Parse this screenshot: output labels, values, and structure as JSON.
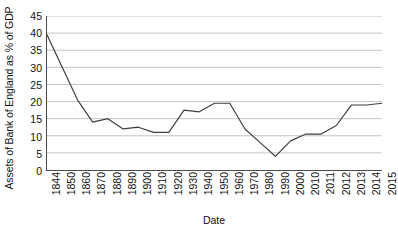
{
  "chart_data": {
    "type": "line",
    "title": "",
    "xlabel": "Date",
    "ylabel": "Assets of Bank of England as % of GDP",
    "categories": [
      "1844",
      "1850",
      "1860",
      "1870",
      "1880",
      "1890",
      "1900",
      "1910",
      "1920",
      "1930",
      "1940",
      "1950",
      "1960",
      "1970",
      "1980",
      "1990",
      "2000",
      "2010",
      "2011",
      "2012",
      "2013",
      "2014",
      "2015"
    ],
    "values": [
      39.5,
      30.0,
      20.5,
      14.0,
      15.0,
      12.0,
      12.5,
      11.0,
      11.0,
      17.5,
      17.0,
      19.5,
      19.5,
      12.0,
      8.0,
      4.0,
      8.5,
      10.5,
      10.5,
      13.0,
      19.0,
      19.0,
      19.5
    ],
    "series": [
      {
        "name": "Assets of Bank of England as % of GDP",
        "values": [
          39.5,
          30.0,
          20.5,
          14.0,
          15.0,
          12.0,
          12.5,
          11.0,
          11.0,
          17.5,
          17.0,
          19.5,
          19.5,
          12.0,
          8.0,
          4.0,
          8.5,
          10.5,
          10.5,
          13.0,
          19.0,
          19.0,
          19.5
        ],
        "color": "#3f3f3f"
      }
    ],
    "ylim": [
      0,
      45
    ],
    "ytick_step": 5,
    "yticks": [
      0,
      5,
      10,
      15,
      20,
      25,
      30,
      35,
      40,
      45
    ],
    "ytick_labels": [
      "0",
      "5",
      "10",
      "15",
      "20",
      "25",
      "30",
      "35",
      "40",
      "45"
    ],
    "grid": {
      "horizontal": true,
      "vertical": false,
      "color": "#b5b5b5"
    },
    "legend": {
      "visible": false,
      "position": "none"
    },
    "axis_color": "#4a4a4a",
    "background": "#ffffff",
    "line_color": "#3f3f3f",
    "line_width": 1.2,
    "markers": "none",
    "xtick_rotation": 90
  }
}
